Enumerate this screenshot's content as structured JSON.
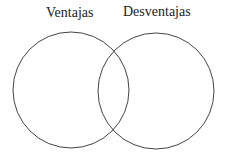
{
  "diagram": {
    "type": "venn",
    "sets": [
      {
        "label": "Ventajas",
        "cx": 71,
        "cy": 90,
        "r": 58
      },
      {
        "label": "Desventajas",
        "cx": 156,
        "cy": 91,
        "r": 58
      }
    ],
    "stroke_color": "#444444"
  }
}
